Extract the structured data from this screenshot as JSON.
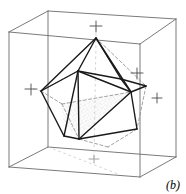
{
  "figure": {
    "panel_label": "(b)",
    "caption_position": "bottom-right",
    "background_color": "#ffffff",
    "line_color": "#1a1a1a",
    "box_line_color": "#6b6b6b",
    "dashed_line_color": "#8a8a8a",
    "stipple_color": "#9a9a9a"
  },
  "bounding_box": {
    "name": "wireframe-cube",
    "stroke": "#6b6b6b",
    "stroke_width": 0.9,
    "vertices": {
      "front_top_left": [
        9,
        32
      ],
      "front_top_right": [
        140,
        44
      ],
      "front_bottom_left": [
        9,
        167
      ],
      "front_bottom_right": [
        140,
        177
      ],
      "back_top_left": [
        48,
        11
      ],
      "back_top_right": [
        176,
        19
      ],
      "back_bottom_left": [
        48,
        147
      ],
      "back_bottom_right": [
        176,
        157
      ]
    },
    "edges": [
      [
        "front_top_left",
        "front_top_right"
      ],
      [
        "front_top_right",
        "front_bottom_right"
      ],
      [
        "front_bottom_right",
        "front_bottom_left"
      ],
      [
        "front_bottom_left",
        "front_top_left"
      ],
      [
        "back_top_left",
        "back_top_right"
      ],
      [
        "back_top_right",
        "back_bottom_right"
      ],
      [
        "back_bottom_right",
        "back_bottom_left"
      ],
      [
        "back_bottom_left",
        "back_top_left"
      ],
      [
        "front_top_left",
        "back_top_left"
      ],
      [
        "front_top_right",
        "back_top_right"
      ],
      [
        "front_bottom_left",
        "back_bottom_left"
      ],
      [
        "front_bottom_right",
        "back_bottom_right"
      ]
    ]
  },
  "polyhedron": {
    "name": "convex-polyhedron",
    "stroke": "#1a1a1a",
    "stroke_width": 1.5,
    "vertices": {
      "apex": [
        96,
        38
      ],
      "left": [
        41,
        91
      ],
      "upper_mid_left": [
        78,
        71
      ],
      "upper_mid_right": [
        121,
        79
      ],
      "right_node": [
        131,
        92
      ],
      "lower_left": [
        64,
        136
      ],
      "bottom": [
        79,
        139
      ],
      "lower_right": [
        137,
        129
      ],
      "back_right": [
        146,
        86
      ],
      "back_low": [
        108,
        147
      ],
      "back_left_hidden": [
        62,
        104
      ]
    },
    "visible_edges": [
      [
        "apex",
        "left"
      ],
      [
        "apex",
        "upper_mid_left"
      ],
      [
        "apex",
        "upper_mid_right"
      ],
      [
        "left",
        "upper_mid_left"
      ],
      [
        "upper_mid_left",
        "upper_mid_right"
      ],
      [
        "upper_mid_right",
        "right_node"
      ],
      [
        "left",
        "lower_left"
      ],
      [
        "upper_mid_left",
        "right_node"
      ],
      [
        "right_node",
        "lower_right"
      ],
      [
        "lower_left",
        "bottom"
      ],
      [
        "bottom",
        "lower_right"
      ],
      [
        "upper_mid_left",
        "bottom"
      ],
      [
        "apex",
        "right_node"
      ],
      [
        "right_node",
        "back_right"
      ],
      [
        "upper_mid_right",
        "back_right"
      ]
    ],
    "hidden_edges": [
      [
        "left",
        "back_left_hidden"
      ],
      [
        "back_left_hidden",
        "bottom"
      ],
      [
        "back_left_hidden",
        "right_node"
      ],
      [
        "apex",
        "back_right"
      ],
      [
        "lower_right",
        "back_low"
      ],
      [
        "back_low",
        "bottom"
      ],
      [
        "back_right",
        "lower_right"
      ]
    ],
    "stippled_face": {
      "name": "stippled-face",
      "polygon": [
        [
          62,
          104
        ],
        [
          131,
          92
        ],
        [
          79,
          139
        ],
        [
          64,
          122
        ]
      ],
      "fill_pattern": "stipple-dots",
      "dot_color": "#9a9a9a"
    }
  },
  "axis_ticks": [
    {
      "name": "tick-top",
      "x": 96,
      "y": 26,
      "size": 6
    },
    {
      "name": "tick-left",
      "x": 31,
      "y": 89,
      "size": 6
    },
    {
      "name": "tick-upper-right",
      "x": 137,
      "y": 73,
      "size": 6
    },
    {
      "name": "tick-right",
      "x": 157,
      "y": 98,
      "size": 5
    },
    {
      "name": "tick-bottom",
      "x": 94,
      "y": 159,
      "size": 5
    }
  ],
  "guide_lines": [
    {
      "name": "guide-vertical-apex",
      "from": [
        96,
        26
      ],
      "to": [
        96,
        38
      ]
    },
    {
      "name": "guide-horizontal-left",
      "from": [
        31,
        89
      ],
      "to": [
        41,
        91
      ]
    },
    {
      "name": "guide-diagonal-bottom",
      "from": [
        96,
        38
      ],
      "to": [
        94,
        159
      ]
    },
    {
      "name": "guide-box-diagonal",
      "from": [
        48,
        147
      ],
      "to": [
        140,
        177
      ]
    }
  ]
}
